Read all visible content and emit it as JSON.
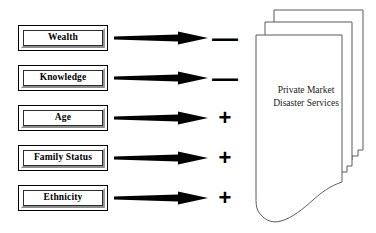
{
  "diagram": {
    "factors": [
      {
        "label": "Wealth",
        "sign": "—",
        "sign_name": "minus-sign",
        "sign_meaning": "negative"
      },
      {
        "label": "Knowledge",
        "sign": "—",
        "sign_name": "minus-sign",
        "sign_meaning": "negative"
      },
      {
        "label": "Age",
        "sign": "+",
        "sign_name": "plus-sign",
        "sign_meaning": "positive"
      },
      {
        "label": "Family Status",
        "sign": "+",
        "sign_name": "plus-sign",
        "sign_meaning": "positive"
      },
      {
        "label": "Ethnicity",
        "sign": "+",
        "sign_name": "plus-sign",
        "sign_meaning": "positive"
      }
    ],
    "target": {
      "line1": "Private Market",
      "line2": "Disaster Services",
      "page_count": 3
    },
    "colors": {
      "stroke": "#000000",
      "page_outline": "#5a5a5a",
      "background": "#ffffff",
      "bevel_light": "#fdfdfd",
      "bevel_dark": "#8d8d8d"
    }
  }
}
